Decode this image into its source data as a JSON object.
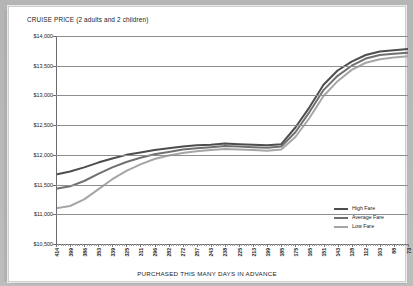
{
  "chart_data": {
    "type": "line",
    "title": "CRUISE PRICE (2 adults and 2 children)",
    "xlabel": "PURCHASED THIS MANY DAYS IN ADVANCE",
    "ylabel": "",
    "ylim": [
      10500,
      14000
    ],
    "ytick_labels": [
      "$14,000",
      "$13,500",
      "$13,000",
      "$12,500",
      "$12,000",
      "$11,500",
      "$11,000",
      "$10,500"
    ],
    "ytick_values": [
      14000,
      13500,
      13000,
      12500,
      12000,
      11500,
      11000,
      10500
    ],
    "grid": true,
    "legend_position": "bottom-right",
    "categories": [
      "414",
      "399",
      "386",
      "353",
      "339",
      "325",
      "311",
      "296",
      "282",
      "272",
      "257",
      "243",
      "238",
      "225",
      "213",
      "199",
      "185",
      "175",
      "165",
      "151",
      "143",
      "128",
      "112",
      "103",
      "88",
      "73"
    ],
    "series": [
      {
        "name": "High Fare",
        "color": "#4d4d4d",
        "values": [
          11670,
          11720,
          11790,
          11870,
          11940,
          12000,
          12040,
          12080,
          12110,
          12140,
          12160,
          12170,
          12190,
          12180,
          12170,
          12160,
          12180,
          12460,
          12800,
          13180,
          13420,
          13570,
          13680,
          13740,
          13760,
          13780
        ]
      },
      {
        "name": "Average Fare",
        "color": "#707070",
        "values": [
          11430,
          11470,
          11560,
          11680,
          11790,
          11880,
          11950,
          12010,
          12050,
          12090,
          12110,
          12130,
          12150,
          12140,
          12130,
          12120,
          12140,
          12380,
          12720,
          13090,
          13330,
          13500,
          13620,
          13680,
          13700,
          13720
        ]
      },
      {
        "name": "Low Fare",
        "color": "#a6a6a6",
        "values": [
          11100,
          11140,
          11250,
          11420,
          11590,
          11730,
          11840,
          11930,
          11990,
          12030,
          12060,
          12080,
          12100,
          12090,
          12080,
          12070,
          12090,
          12300,
          12620,
          12990,
          13240,
          13430,
          13550,
          13610,
          13640,
          13660
        ]
      }
    ],
    "legend": [
      {
        "label": "High Fare",
        "color": "#4d4d4d"
      },
      {
        "label": "Average Fare",
        "color": "#707070"
      },
      {
        "label": "Low Fare",
        "color": "#a6a6a6"
      }
    ]
  }
}
